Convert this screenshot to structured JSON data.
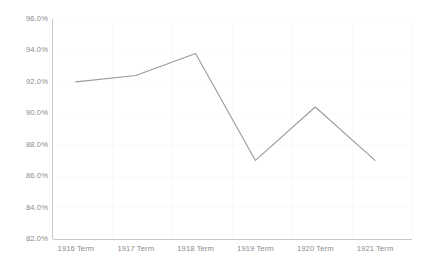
{
  "chart_data": {
    "type": "line",
    "title": "",
    "subtitle": "",
    "xlabel": "",
    "ylabel": "",
    "categories": [
      "1916 Term",
      "1917 Term",
      "1918 Term",
      "1919 Term",
      "1920 Term",
      "1921 Term"
    ],
    "series": [
      {
        "name": "",
        "values": [
          92.0,
          92.4,
          93.8,
          87.0,
          90.4,
          87.0
        ]
      }
    ],
    "ylim": [
      82.0,
      96.0
    ],
    "ytick_values": [
      96.0,
      94.0,
      92.0,
      90.0,
      88.0,
      86.0,
      84.0,
      82.0
    ],
    "ytick_labels": [
      "96.0%",
      "94.0%",
      "92.0%",
      "90.0%",
      "88.0%",
      "86.0%",
      "84.0%",
      "82.0%"
    ],
    "xtick_labels": [
      "1916 Term",
      "1917 Term",
      "1918 Term",
      "1919 Term",
      "1920 Term",
      "1921 Term"
    ],
    "grid": true,
    "grid_axis": "both",
    "legend": false,
    "legend_position": "none",
    "markers": false,
    "annotations": []
  },
  "style": {
    "line_color": "#9a9a9a",
    "grid_color": "#fafafa",
    "axis_color": "#c8c8c8",
    "tick_text_color": "#8a8a8a",
    "background": "#ffffff"
  }
}
